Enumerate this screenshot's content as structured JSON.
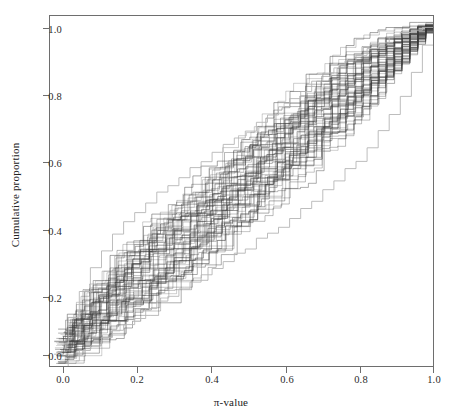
{
  "chart_data": {
    "type": "line",
    "title": "",
    "subtitle": "",
    "xlabel": "π-value",
    "ylabel": "Cumulative proportion",
    "xlim": [
      0.0,
      1.0
    ],
    "ylim": [
      0.0,
      1.02
    ],
    "grid": false,
    "legend": "none",
    "xticks": [
      {
        "value": 0.0,
        "label": "0.0"
      },
      {
        "value": 0.2,
        "label": "0.2"
      },
      {
        "value": 0.4,
        "label": "0.4"
      },
      {
        "value": 0.6,
        "label": "0.6"
      },
      {
        "value": 0.8,
        "label": "0.8"
      },
      {
        "value": 1.0,
        "label": "1.0"
      }
    ],
    "yticks": [
      {
        "value": 0.0,
        "label": "0.0"
      },
      {
        "value": 0.2,
        "label": "0.2"
      },
      {
        "value": 0.4,
        "label": "0.4"
      },
      {
        "value": 0.6,
        "label": "0.6"
      },
      {
        "value": 0.8,
        "label": "0.8"
      },
      {
        "value": 1.0,
        "label": "1.0"
      }
    ],
    "series_count": 60,
    "line_color": "#3c3c3c",
    "outlier_color": "#b5b5b5",
    "series": [
      {
        "name": "band-center-reference",
        "x": [
          0.02,
          0.1,
          0.2,
          0.3,
          0.4,
          0.5,
          0.6,
          0.7,
          0.8,
          0.9,
          1.0
        ],
        "values": [
          0.03,
          0.11,
          0.22,
          0.32,
          0.42,
          0.52,
          0.62,
          0.73,
          0.83,
          0.93,
          1.0
        ]
      },
      {
        "name": "band-upper-envelope",
        "x": [
          0.02,
          0.1,
          0.2,
          0.3,
          0.4,
          0.5,
          0.6,
          0.7,
          0.8,
          0.9,
          1.0
        ],
        "values": [
          0.1,
          0.23,
          0.36,
          0.46,
          0.56,
          0.66,
          0.76,
          0.86,
          0.94,
          0.99,
          1.0
        ]
      },
      {
        "name": "band-lower-envelope",
        "x": [
          0.02,
          0.1,
          0.2,
          0.3,
          0.4,
          0.5,
          0.6,
          0.7,
          0.8,
          0.9,
          1.0
        ],
        "values": [
          0.0,
          0.03,
          0.1,
          0.19,
          0.28,
          0.38,
          0.48,
          0.59,
          0.71,
          0.85,
          1.0
        ]
      },
      {
        "name": "outlier-low",
        "x": [
          0.02,
          0.1,
          0.2,
          0.3,
          0.4,
          0.5,
          0.6,
          0.7,
          0.8,
          0.9,
          0.95,
          1.0
        ],
        "values": [
          0.0,
          0.06,
          0.13,
          0.2,
          0.27,
          0.34,
          0.41,
          0.5,
          0.6,
          0.75,
          0.88,
          1.0
        ]
      },
      {
        "name": "outlier-high-left",
        "x": [
          0.02,
          0.06,
          0.1,
          0.15,
          0.2,
          0.3,
          0.4,
          0.5,
          0.6,
          0.7,
          0.8,
          0.9,
          1.0
        ],
        "values": [
          0.07,
          0.17,
          0.27,
          0.37,
          0.43,
          0.52,
          0.6,
          0.68,
          0.76,
          0.84,
          0.91,
          0.97,
          1.0
        ]
      }
    ]
  },
  "axes": {
    "frame_color": "#6e6e6e",
    "tick_color": "#6e6e6e",
    "background": "#ffffff"
  }
}
